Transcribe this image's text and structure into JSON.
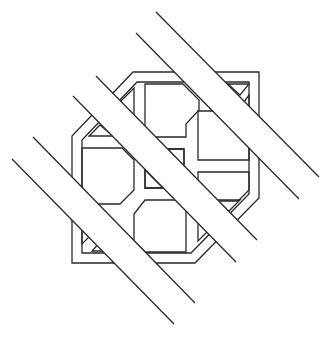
{
  "figure": {
    "title": "Interlaced geometric lattice with diagonal bands",
    "background": "#ffffff",
    "line_color": "#2a2a2a",
    "frame": {
      "outer": [
        [
          133,
          72
        ],
        [
          259,
          72
        ],
        [
          259,
          198
        ],
        [
          195,
          263
        ],
        [
          72,
          263
        ],
        [
          72,
          136
        ]
      ],
      "inner": [
        [
          137,
          82
        ],
        [
          249,
          82
        ],
        [
          249,
          194
        ],
        [
          191,
          253
        ],
        [
          82,
          253
        ],
        [
          82,
          140
        ]
      ]
    },
    "cells": [
      {
        "name": "top-cell",
        "points": [
          [
            145,
            84
          ],
          [
            183,
            84
          ],
          [
            199,
            100
          ],
          [
            199,
            110
          ],
          [
            186,
            124
          ],
          [
            186,
            137
          ],
          [
            145,
            137
          ]
        ]
      },
      {
        "name": "right-cell",
        "points": [
          [
            198,
            111
          ],
          [
            238,
            111
          ],
          [
            249,
            111
          ],
          [
            249,
            160
          ],
          [
            198,
            160
          ],
          [
            198,
            124
          ]
        ]
      },
      {
        "name": "left-cell",
        "points": [
          [
            82,
            148
          ],
          [
            122,
            148
          ],
          [
            134,
            160
          ],
          [
            134,
            190
          ],
          [
            120,
            204
          ],
          [
            82,
            204
          ]
        ]
      },
      {
        "name": "bottom-cell",
        "points": [
          [
            145,
            200
          ],
          [
            186,
            200
          ],
          [
            186,
            252
          ],
          [
            145,
            252
          ],
          [
            134,
            241
          ],
          [
            134,
            214
          ]
        ]
      },
      {
        "name": "center-square",
        "points": [
          [
            145,
            149
          ],
          [
            184,
            149
          ],
          [
            184,
            188
          ],
          [
            145,
            188
          ]
        ]
      },
      {
        "name": "right-lower-cell",
        "points": [
          [
            198,
            172
          ],
          [
            249,
            172
          ],
          [
            249,
            190
          ],
          [
            238,
            201
          ],
          [
            198,
            201
          ]
        ]
      }
    ],
    "triangles": [
      {
        "name": "top-left-triangle-a",
        "points": [
          [
            134,
            88
          ],
          [
            134,
            120
          ],
          [
            118,
            104
          ]
        ]
      },
      {
        "name": "top-left-triangle-b",
        "points": [
          [
            89,
            136
          ],
          [
            113,
            136
          ],
          [
            100,
            125
          ]
        ]
      },
      {
        "name": "top-right-triangle-a",
        "points": [
          [
            228,
            84
          ],
          [
            249,
            84
          ],
          [
            240,
            95
          ]
        ]
      },
      {
        "name": "top-right-triangle-b",
        "points": [
          [
            249,
            95
          ],
          [
            249,
            115
          ],
          [
            241,
            106
          ]
        ]
      },
      {
        "name": "center-left-triangle",
        "points": [
          [
            145,
            170
          ],
          [
            145,
            188
          ],
          [
            163,
            188
          ]
        ]
      },
      {
        "name": "center-right-triangle",
        "points": [
          [
            184,
            149
          ],
          [
            184,
            168
          ],
          [
            168,
            149
          ]
        ]
      },
      {
        "name": "bottom-left-triangle-a",
        "points": [
          [
            82,
            216
          ],
          [
            82,
            244
          ],
          [
            96,
            230
          ]
        ]
      },
      {
        "name": "bottom-left-triangle-b",
        "points": [
          [
            92,
            251
          ],
          [
            110,
            251
          ],
          [
            101,
            241
          ]
        ]
      },
      {
        "name": "bottom-right-triangle-a",
        "points": [
          [
            217,
            200
          ],
          [
            240,
            200
          ],
          [
            228,
            212
          ]
        ]
      },
      {
        "name": "bottom-right-triangle-b",
        "points": [
          [
            198,
            213
          ],
          [
            198,
            241
          ],
          [
            212,
            227
          ]
        ]
      }
    ],
    "bands": [
      {
        "name": "band-upper",
        "line1": [
          [
            156,
            12
          ],
          [
            319,
            177
          ]
        ],
        "line2": [
          [
            136,
            33
          ],
          [
            299,
            199
          ]
        ]
      },
      {
        "name": "band-middle",
        "line1": [
          [
            96,
            76
          ],
          [
            257,
            240
          ]
        ],
        "line2": [
          [
            73,
            96
          ],
          [
            236,
            262
          ]
        ]
      },
      {
        "name": "band-lower",
        "line1": [
          [
            33,
            137
          ],
          [
            195,
            303
          ]
        ],
        "line2": [
          [
            12,
            159
          ],
          [
            174,
            324
          ]
        ]
      }
    ]
  }
}
